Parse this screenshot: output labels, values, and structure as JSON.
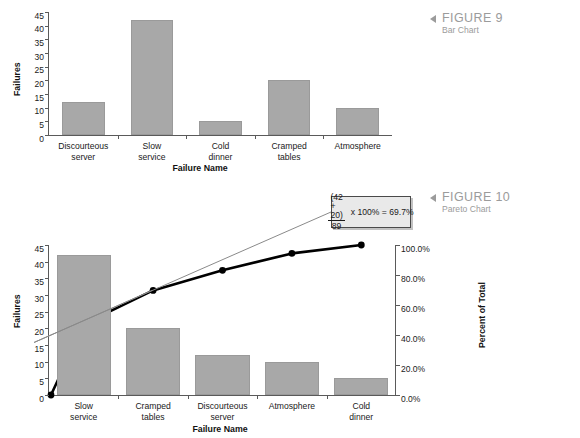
{
  "figures": [
    {
      "id": "figure-9",
      "label": "FIGURE 9",
      "caption": "Bar Chart"
    },
    {
      "id": "figure-10",
      "label": "FIGURE 10",
      "caption": "Pareto Chart"
    }
  ],
  "callout": {
    "numerator": "(42 + 20)",
    "denominator": "89",
    "expression": "x 100% = 69.7%"
  },
  "colors": {
    "bar_fill": "#a8a8a8",
    "bar_stroke": "#9a9a9a",
    "axis": "#5a5a5a",
    "line": "#000000",
    "caption_gray": "#9b9b9b",
    "callout_bg": "#e9e9e9"
  },
  "chart_data": [
    {
      "type": "bar",
      "title": "",
      "xlabel": "Failure Name",
      "ylabel": "Failures",
      "categories": [
        "Discourteous server",
        "Slow service",
        "Cold dinner",
        "Cramped tables",
        "Atmosphere"
      ],
      "category_lines": [
        [
          "Discourteous",
          "server"
        ],
        [
          "Slow",
          "service"
        ],
        [
          "Cold",
          "dinner"
        ],
        [
          "Cramped",
          "tables"
        ],
        [
          "Atmosphere",
          ""
        ]
      ],
      "values": [
        12,
        42,
        5,
        20,
        10
      ],
      "ylim": [
        0,
        45
      ],
      "yticks": [
        45,
        40,
        35,
        30,
        25,
        20,
        15,
        10,
        5,
        0
      ],
      "grid": false,
      "legend": "none"
    },
    {
      "type": "bar",
      "title": "",
      "xlabel": "Failure Name",
      "ylabel": "Failures",
      "y2label": "Percent of Total",
      "categories": [
        "Slow service",
        "Cramped tables",
        "Discourteous server",
        "Atmosphere",
        "Cold dinner"
      ],
      "category_lines": [
        [
          "Slow",
          "service"
        ],
        [
          "Cramped",
          "tables"
        ],
        [
          "Discourteous",
          "server"
        ],
        [
          "Atmosphere",
          ""
        ],
        [
          "Cold",
          "dinner"
        ]
      ],
      "values": [
        42,
        20,
        12,
        10,
        5
      ],
      "ylim": [
        0,
        45
      ],
      "yticks": [
        45,
        40,
        35,
        30,
        25,
        20,
        15,
        10,
        5,
        0
      ],
      "y2lim": [
        0,
        100
      ],
      "y2ticks": [
        "100.0%",
        "80.0%",
        "60.0%",
        "40.0%",
        "20.0%",
        "0.0%"
      ],
      "y2tick_values": [
        100,
        80,
        60,
        40,
        20,
        0
      ],
      "cumulative_percent": [
        0,
        47.2,
        69.7,
        83.1,
        94.4,
        100.0
      ],
      "grid": false,
      "legend": "none"
    }
  ]
}
